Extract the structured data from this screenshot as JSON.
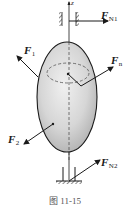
{
  "figure": {
    "caption": "图 11-15",
    "axis_label": "z",
    "forces": [
      {
        "id": "FN1",
        "symbol": "F",
        "subscript": "N1"
      },
      {
        "id": "F1",
        "symbol": "F",
        "subscript": "1"
      },
      {
        "id": "Fn",
        "symbol": "F",
        "subscript": "n"
      },
      {
        "id": "F2",
        "symbol": "F",
        "subscript": "2"
      },
      {
        "id": "FN2",
        "symbol": "F",
        "subscript": "N2"
      }
    ],
    "colors": {
      "line": "#1a1a1a",
      "body_fill_light": "#e9e9e9",
      "body_fill_dark": "#b8b8b8",
      "dashed": "#555555"
    }
  }
}
